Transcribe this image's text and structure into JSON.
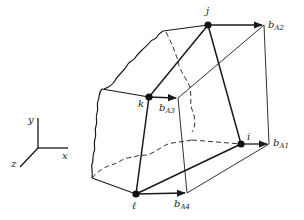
{
  "figure": {
    "type": "3D element deformation diagram",
    "colors": {
      "stroke": "#1a1a1a",
      "background": "#ffffff"
    }
  },
  "axes_triad": {
    "labels": {
      "y": "y",
      "x": "x",
      "z": "z"
    }
  },
  "nodes": [
    {
      "id": "j",
      "label": "j"
    },
    {
      "id": "k",
      "label": "k"
    },
    {
      "id": "i",
      "label": "i"
    },
    {
      "id": "l",
      "label": "ℓ"
    }
  ],
  "vectors": [
    {
      "id": "bA2",
      "base": "b",
      "sub": "A2"
    },
    {
      "id": "bA3",
      "base": "b",
      "sub": "A3"
    },
    {
      "id": "bA1",
      "base": "b",
      "sub": "A1"
    },
    {
      "id": "bA4",
      "base": "b",
      "sub": "A4"
    }
  ]
}
